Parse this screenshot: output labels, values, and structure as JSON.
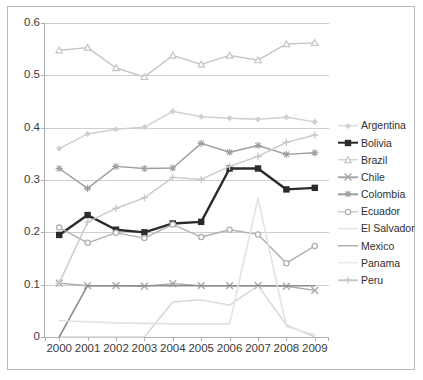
{
  "chart_data": {
    "type": "line",
    "title": "",
    "subtitle": "",
    "xlabel": "",
    "ylabel": "",
    "categories": [
      "2000",
      "2001",
      "2002",
      "2003",
      "2004",
      "2005",
      "2006",
      "2007",
      "2008",
      "2009"
    ],
    "x": [
      2000,
      2001,
      2002,
      2003,
      2004,
      2005,
      2006,
      2007,
      2008,
      2009
    ],
    "ylim": [
      0,
      0.6
    ],
    "yticks": [
      "0",
      "0.1",
      "0.2",
      "0.3",
      "0.4",
      "0.5",
      "0.6"
    ],
    "ytick_values": [
      0,
      0.1,
      0.2,
      0.3,
      0.4,
      0.5,
      0.6
    ],
    "grid": "horizontal",
    "legend_position": "right",
    "series": [
      {
        "name": "Argentina",
        "color": "#cfcfcf",
        "marker": "diamond",
        "width": 1.4,
        "values": [
          0.36,
          0.388,
          0.397,
          0.401,
          0.431,
          0.421,
          0.418,
          0.416,
          0.42,
          0.411
        ]
      },
      {
        "name": "Bolivia",
        "color": "#2b2b2b",
        "marker": "square",
        "width": 2.4,
        "values": [
          0.195,
          0.233,
          0.205,
          0.2,
          0.217,
          0.22,
          0.322,
          0.322,
          0.282,
          0.285
        ]
      },
      {
        "name": "Brazil",
        "color": "#c4c4c4",
        "marker": "triangle",
        "width": 1.4,
        "values": [
          0.548,
          0.553,
          0.514,
          0.497,
          0.538,
          0.521,
          0.538,
          0.529,
          0.56,
          0.562
        ]
      },
      {
        "name": "Chile",
        "color": "#a8a8a8",
        "marker": "cross",
        "width": 1.4,
        "values": [
          0.103,
          0.098,
          0.098,
          0.097,
          0.102,
          0.098,
          0.098,
          0.098,
          0.097,
          0.089
        ]
      },
      {
        "name": "Colombia",
        "color": "#9e9e9e",
        "marker": "star",
        "width": 1.4,
        "values": [
          0.322,
          0.284,
          0.326,
          0.322,
          0.323,
          0.37,
          0.353,
          0.366,
          0.349,
          0.352
        ]
      },
      {
        "name": "Ecuador",
        "color": "#b0b0b0",
        "marker": "circle",
        "width": 1.4,
        "values": [
          0.209,
          0.18,
          0.199,
          0.189,
          0.215,
          0.191,
          0.205,
          0.196,
          0.141,
          0.174
        ]
      },
      {
        "name": "El Salvador",
        "color": "#d6d6d6",
        "marker": "none",
        "width": 1.4,
        "values": [
          0.0,
          0.0,
          0.0,
          0.0,
          0.067,
          0.071,
          0.061,
          0.098,
          0.023,
          0.0
        ]
      },
      {
        "name": "Mexico",
        "color": "#8d8d8d",
        "marker": "none",
        "width": 1.6,
        "values": [
          0.0,
          0.098,
          0.098,
          0.098,
          0.098,
          0.098,
          0.098,
          0.098,
          0.098,
          0.098
        ]
      },
      {
        "name": "Panama",
        "color": "#e2e2e2",
        "marker": "none",
        "width": 1.6,
        "values": [
          0.031,
          0.029,
          0.027,
          0.026,
          0.025,
          0.025,
          0.025,
          0.265,
          0.02,
          0.004
        ]
      },
      {
        "name": "Peru",
        "color": "#c9c9c9",
        "marker": "plus",
        "width": 1.4,
        "values": [
          0.103,
          0.22,
          0.246,
          0.266,
          0.305,
          0.301,
          0.326,
          0.345,
          0.372,
          0.386
        ]
      }
    ]
  },
  "legend": {
    "items": [
      {
        "label": "Argentina"
      },
      {
        "label": "Bolivia"
      },
      {
        "label": "Brazil"
      },
      {
        "label": "Chile"
      },
      {
        "label": "Colombia"
      },
      {
        "label": "Ecuador"
      },
      {
        "label": "El Salvador"
      },
      {
        "label": "Mexico"
      },
      {
        "label": "Panama"
      },
      {
        "label": "Peru"
      }
    ]
  },
  "style": {
    "plot_border": "#aeaeae",
    "gridline": "#cfcfcf",
    "frame_border": "#b9b9b9",
    "background": "#ffffff",
    "text": "#3a3a3a"
  }
}
